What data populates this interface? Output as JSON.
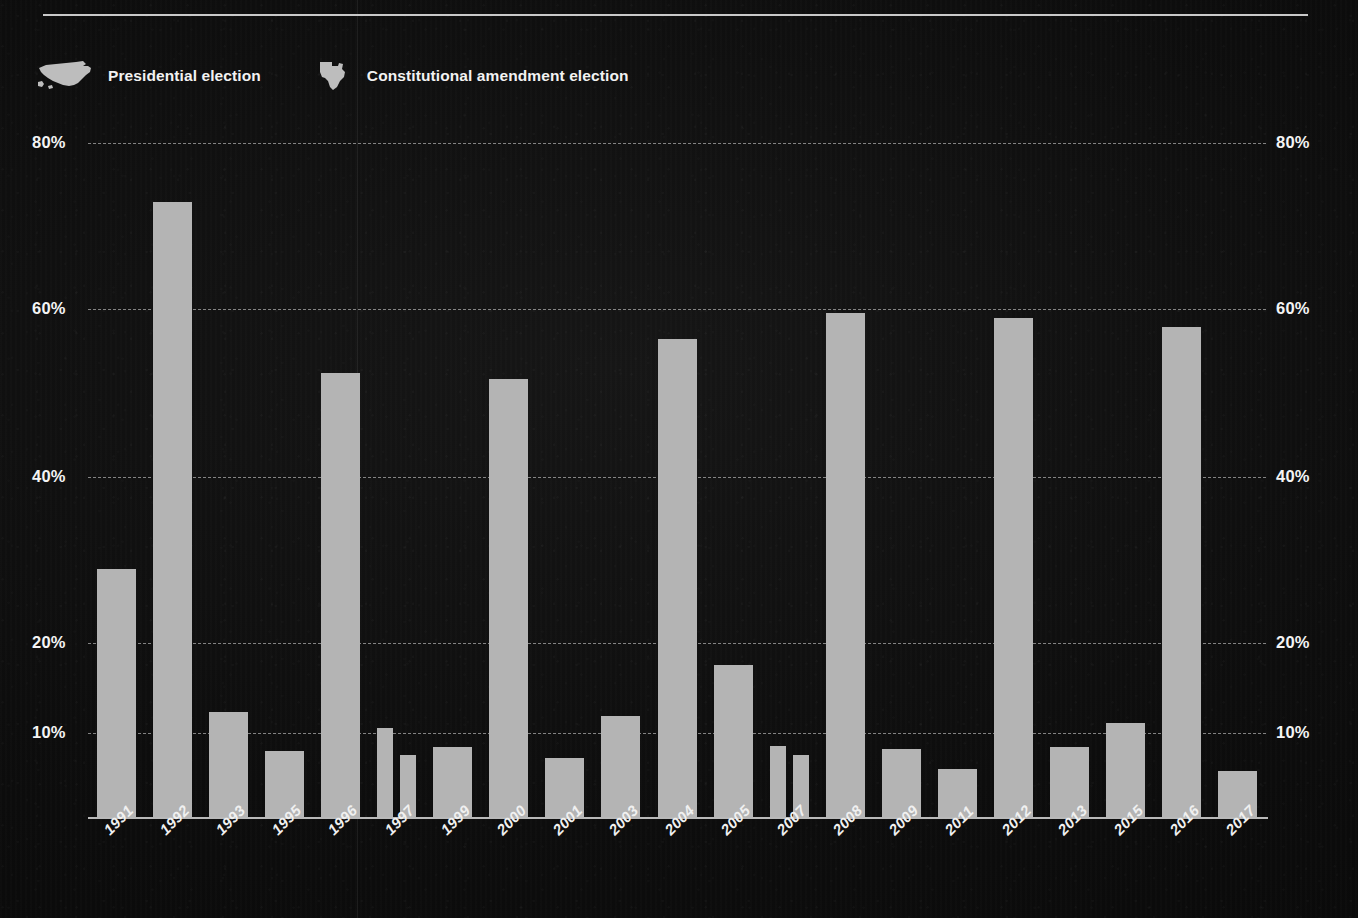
{
  "legend": {
    "items": [
      {
        "icon": "us-map-icon",
        "label": "Presidential election"
      },
      {
        "icon": "texas-map-icon",
        "label": "Constitutional amendment election"
      }
    ]
  },
  "axis": {
    "y_ticks": [
      "80%",
      "60%",
      "40%",
      "20%",
      "10%"
    ],
    "y_tick_values": [
      80,
      60,
      40,
      20,
      10
    ]
  },
  "colors": {
    "bar": "#b4b4b4",
    "text": "#f2f2f2",
    "gridline": "#e1e1e1",
    "background": "#0d0d0d",
    "rule": "#c9c9c9"
  },
  "chart_data": {
    "type": "bar",
    "title": "",
    "subtitle": "",
    "xlabel": "",
    "ylabel": "",
    "grid": true,
    "legend_position": "top-left",
    "ylim": [
      0,
      80
    ],
    "y_gridlines": [
      10,
      20,
      40,
      60,
      80
    ],
    "categories": [
      "1991",
      "1992",
      "1993",
      "1995",
      "1996",
      "1997",
      "1999",
      "2000",
      "2001",
      "2003",
      "2004",
      "2005",
      "2007",
      "2008",
      "2009",
      "2011",
      "2012",
      "2013",
      "2015",
      "2016",
      "2017"
    ],
    "bars": [
      {
        "year": "1991",
        "value": 29.0,
        "election_type": "Constitutional amendment election"
      },
      {
        "year": "1992",
        "value": 73.0,
        "election_type": "Presidential election"
      },
      {
        "year": "1993",
        "value": 12.5,
        "election_type": "Constitutional amendment election"
      },
      {
        "year": "1995",
        "value": 8.0,
        "election_type": "Constitutional amendment election"
      },
      {
        "year": "1996",
        "value": 52.5,
        "election_type": "Presidential election"
      },
      {
        "year": "1997",
        "value": 10.7,
        "election_type": "Constitutional amendment election"
      },
      {
        "year": "1997",
        "value": 7.5,
        "election_type": "Constitutional amendment election"
      },
      {
        "year": "1999",
        "value": 8.5,
        "election_type": "Constitutional amendment election"
      },
      {
        "year": "2000",
        "value": 51.8,
        "election_type": "Presidential election"
      },
      {
        "year": "2001",
        "value": 7.2,
        "election_type": "Constitutional amendment election"
      },
      {
        "year": "2003",
        "value": 12.0,
        "election_type": "Constitutional amendment election"
      },
      {
        "year": "2004",
        "value": 56.5,
        "election_type": "Presidential election"
      },
      {
        "year": "2005",
        "value": 17.7,
        "election_type": "Constitutional amendment election"
      },
      {
        "year": "2007",
        "value": 8.6,
        "election_type": "Constitutional amendment election"
      },
      {
        "year": "2007",
        "value": 7.5,
        "election_type": "Constitutional amendment election"
      },
      {
        "year": "2008",
        "value": 59.7,
        "election_type": "Presidential election"
      },
      {
        "year": "2009",
        "value": 8.2,
        "election_type": "Constitutional amendment election"
      },
      {
        "year": "2011",
        "value": 5.8,
        "election_type": "Constitutional amendment election"
      },
      {
        "year": "2012",
        "value": 59.0,
        "election_type": "Presidential election"
      },
      {
        "year": "2013",
        "value": 8.5,
        "election_type": "Constitutional amendment election"
      },
      {
        "year": "2015",
        "value": 11.2,
        "election_type": "Constitutional amendment election"
      },
      {
        "year": "2016",
        "value": 58.0,
        "election_type": "Presidential election"
      },
      {
        "year": "2017",
        "value": 5.6,
        "election_type": "Constitutional amendment election"
      }
    ]
  }
}
